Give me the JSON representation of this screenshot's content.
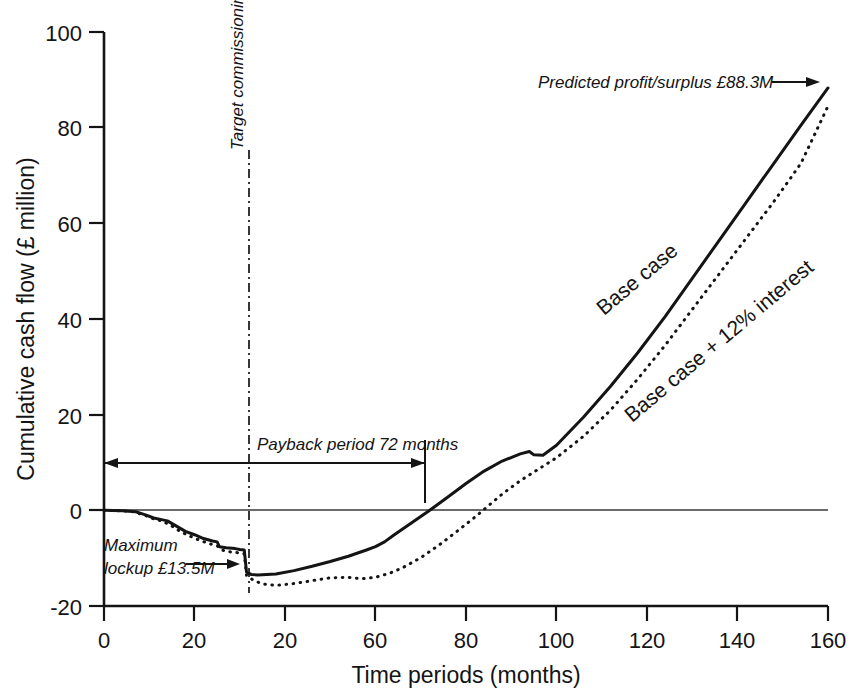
{
  "chart_data": {
    "type": "line",
    "title": "",
    "xlabel": "Time periods (months)",
    "ylabel": "Cumulative cash flow (£ million)",
    "xlim": [
      0,
      160
    ],
    "ylim": [
      -20,
      100
    ],
    "xticks": [
      0,
      20,
      40,
      60,
      80,
      100,
      120,
      140,
      160
    ],
    "xtick_labels": [
      "0",
      "20",
      "20",
      "60",
      "80",
      "100",
      "120",
      "140",
      "160"
    ],
    "yticks": [
      -20,
      0,
      20,
      40,
      60,
      80,
      100
    ],
    "ytick_labels": [
      "-20",
      "0",
      "20",
      "40",
      "60",
      "80",
      "100"
    ],
    "grid": false,
    "legend_position": "inline-along-curves",
    "series": [
      {
        "name": "Base case",
        "style": "solid",
        "color": "#141414",
        "points": [
          [
            0,
            0.0
          ],
          [
            4,
            -0.1
          ],
          [
            7,
            -0.3
          ],
          [
            9,
            -0.9
          ],
          [
            11,
            -1.6
          ],
          [
            13,
            -2.0
          ],
          [
            14,
            -2.2
          ],
          [
            16,
            -3.3
          ],
          [
            18,
            -4.4
          ],
          [
            20,
            -5.1
          ],
          [
            22,
            -5.9
          ],
          [
            24,
            -6.4
          ],
          [
            25,
            -6.6
          ],
          [
            25.5,
            -7.6
          ],
          [
            27,
            -7.8
          ],
          [
            29,
            -8.0
          ],
          [
            30,
            -8.2
          ],
          [
            31,
            -8.3
          ],
          [
            31.5,
            -12.9
          ],
          [
            32.5,
            -13.4
          ],
          [
            34,
            -13.5
          ],
          [
            38,
            -13.3
          ],
          [
            42,
            -12.6
          ],
          [
            46,
            -11.7
          ],
          [
            50,
            -10.7
          ],
          [
            54,
            -9.6
          ],
          [
            58,
            -8.3
          ],
          [
            60,
            -7.6
          ],
          [
            62,
            -6.6
          ],
          [
            64,
            -5.2
          ],
          [
            68,
            -2.6
          ],
          [
            72,
            0.0
          ],
          [
            76,
            2.8
          ],
          [
            80,
            5.6
          ],
          [
            84,
            8.2
          ],
          [
            88,
            10.3
          ],
          [
            92,
            11.8
          ],
          [
            94,
            12.3
          ],
          [
            95,
            11.6
          ],
          [
            97,
            11.5
          ],
          [
            100,
            13.6
          ],
          [
            106,
            19.5
          ],
          [
            112,
            26.0
          ],
          [
            118,
            33.0
          ],
          [
            124,
            40.5
          ],
          [
            130,
            48.5
          ],
          [
            136,
            56.5
          ],
          [
            142,
            64.5
          ],
          [
            148,
            72.5
          ],
          [
            154,
            80.5
          ],
          [
            160,
            88.3
          ]
        ]
      },
      {
        "name": "Base case + 12% interest",
        "style": "dotted",
        "color": "#141414",
        "points": [
          [
            0,
            0.0
          ],
          [
            6,
            -0.2
          ],
          [
            9,
            -1.0
          ],
          [
            11,
            -1.8
          ],
          [
            13,
            -2.3
          ],
          [
            15,
            -3.3
          ],
          [
            17,
            -4.5
          ],
          [
            19,
            -5.4
          ],
          [
            21,
            -6.2
          ],
          [
            23,
            -6.9
          ],
          [
            25,
            -7.4
          ],
          [
            26,
            -8.3
          ],
          [
            28,
            -8.7
          ],
          [
            30,
            -8.9
          ],
          [
            31,
            -9.1
          ],
          [
            31.5,
            -13.6
          ],
          [
            33,
            -14.6
          ],
          [
            35,
            -15.4
          ],
          [
            38,
            -15.7
          ],
          [
            42,
            -15.3
          ],
          [
            46,
            -14.7
          ],
          [
            50,
            -14.1
          ],
          [
            54,
            -14.0
          ],
          [
            57,
            -14.3
          ],
          [
            60,
            -14.0
          ],
          [
            63,
            -13.2
          ],
          [
            66,
            -12.0
          ],
          [
            70,
            -9.9
          ],
          [
            74,
            -7.3
          ],
          [
            78,
            -4.4
          ],
          [
            82,
            -1.4
          ],
          [
            85,
            1.0
          ],
          [
            88,
            3.4
          ],
          [
            92,
            6.2
          ],
          [
            96,
            8.6
          ],
          [
            100,
            11.0
          ],
          [
            106,
            15.5
          ],
          [
            112,
            21.0
          ],
          [
            118,
            27.5
          ],
          [
            124,
            34.5
          ],
          [
            130,
            42.0
          ],
          [
            136,
            49.5
          ],
          [
            142,
            57.0
          ],
          [
            148,
            64.5
          ],
          [
            154,
            72.5
          ],
          [
            160,
            84.5
          ]
        ]
      }
    ],
    "annotations": [
      {
        "id": "predicted-profit",
        "text": "Predicted profit/surplus £88.3M",
        "arrow": "right",
        "value": 88.3
      },
      {
        "id": "maximum-lockup",
        "text_line_1": "Maximum",
        "text_line_2": "lockup £13.5M",
        "arrow": "right",
        "value": -13.5
      },
      {
        "id": "payback-period",
        "text": "Payback period 72 months",
        "arrow": "double",
        "value": 72
      },
      {
        "id": "target-commissioning-date",
        "text": "Target commissioning date",
        "orientation": "vertical",
        "line_style": "dash-dot",
        "x_value": 32
      }
    ]
  }
}
